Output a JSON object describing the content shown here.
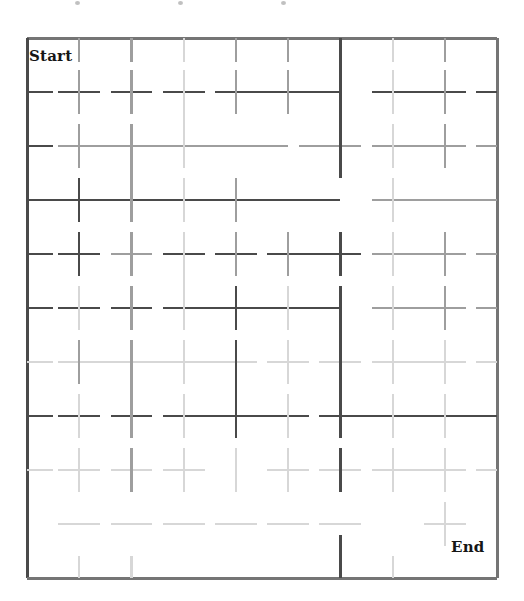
{
  "page": {
    "width": 524,
    "height": 601,
    "background": "#ffffff",
    "kind": "maze-grid-puzzle"
  },
  "labels": {
    "start": "Start",
    "end": "End"
  },
  "colors": {
    "border": "#757575",
    "line_dark": "#4a4a4a",
    "line_mid": "#9e9e9e",
    "line_light": "#d7d7d7",
    "label_text": "#161616",
    "background": "#ffffff"
  },
  "grid": {
    "x0": 27,
    "y0": 38,
    "x1": 497,
    "y1": 578,
    "cols": 9,
    "rows": 10,
    "cell_w": 52.2,
    "cell_h": 54.0,
    "col_x": [
      27,
      79.2,
      131.4,
      183.7,
      235.9,
      288.1,
      340.3,
      392.6,
      444.8,
      497
    ],
    "row_y": [
      38,
      92,
      146,
      200,
      254,
      308,
      362,
      416,
      470,
      524,
      578
    ]
  },
  "border": {
    "top": {
      "x1": 27,
      "y1": 38,
      "x2": 497,
      "y2": 38,
      "shade": "border",
      "width": 3
    },
    "left": {
      "x1": 27,
      "y1": 38,
      "x2": 27,
      "y2": 578,
      "shade": "line_dark",
      "width": 3
    },
    "right": {
      "x1": 497,
      "y1": 38,
      "x2": 497,
      "y2": 578,
      "shade": "border",
      "width": 3
    },
    "bottom": {
      "x1": 27,
      "y1": 578,
      "x2": 497,
      "y2": 578,
      "shade": "border",
      "width": 3
    }
  },
  "chart_data": {
    "type": "table",
    "xlabel": "column index",
    "ylabel": "row index",
    "note": "Each segment is drawn centered on a grid node and extends roughly one half-cell to each side. shade = dark | mid | light.",
    "horizontal_segments": [
      {
        "row": 1,
        "col_from": 0,
        "col_to": 0.5,
        "shade": "dark"
      },
      {
        "row": 1,
        "col_from": 0.6,
        "col_to": 1.4,
        "shade": "dark"
      },
      {
        "row": 1,
        "col_from": 1.6,
        "col_to": 2.4,
        "shade": "dark"
      },
      {
        "row": 1,
        "col_from": 2.6,
        "col_to": 3.4,
        "shade": "dark"
      },
      {
        "row": 1,
        "col_from": 3.6,
        "col_to": 6.0,
        "shade": "dark"
      },
      {
        "row": 1,
        "col_from": 6.6,
        "col_to": 8.4,
        "shade": "dark"
      },
      {
        "row": 1,
        "col_from": 8.6,
        "col_to": 9.0,
        "shade": "dark"
      },
      {
        "row": 2,
        "col_from": 0,
        "col_to": 0.5,
        "shade": "dark"
      },
      {
        "row": 2,
        "col_from": 0.6,
        "col_to": 5.0,
        "shade": "mid"
      },
      {
        "row": 2,
        "col_from": 5.2,
        "col_to": 6.4,
        "shade": "mid"
      },
      {
        "row": 2,
        "col_from": 6.6,
        "col_to": 8.4,
        "shade": "mid"
      },
      {
        "row": 2,
        "col_from": 8.6,
        "col_to": 9.0,
        "shade": "mid"
      },
      {
        "row": 3,
        "col_from": 0,
        "col_to": 6.0,
        "shade": "dark"
      },
      {
        "row": 3,
        "col_from": 6.6,
        "col_to": 9.0,
        "shade": "mid"
      },
      {
        "row": 4,
        "col_from": 0,
        "col_to": 0.5,
        "shade": "dark"
      },
      {
        "row": 4,
        "col_from": 0.6,
        "col_to": 1.4,
        "shade": "dark"
      },
      {
        "row": 4,
        "col_from": 1.6,
        "col_to": 2.4,
        "shade": "mid"
      },
      {
        "row": 4,
        "col_from": 2.6,
        "col_to": 3.4,
        "shade": "dark"
      },
      {
        "row": 4,
        "col_from": 3.6,
        "col_to": 4.4,
        "shade": "dark"
      },
      {
        "row": 4,
        "col_from": 4.6,
        "col_to": 6.4,
        "shade": "dark"
      },
      {
        "row": 4,
        "col_from": 6.6,
        "col_to": 8.4,
        "shade": "mid"
      },
      {
        "row": 4,
        "col_from": 8.6,
        "col_to": 9.0,
        "shade": "mid"
      },
      {
        "row": 5,
        "col_from": 0,
        "col_to": 0.5,
        "shade": "dark"
      },
      {
        "row": 5,
        "col_from": 0.6,
        "col_to": 1.4,
        "shade": "dark"
      },
      {
        "row": 5,
        "col_from": 1.6,
        "col_to": 2.4,
        "shade": "dark"
      },
      {
        "row": 5,
        "col_from": 2.6,
        "col_to": 6.0,
        "shade": "dark"
      },
      {
        "row": 5,
        "col_from": 6.6,
        "col_to": 8.4,
        "shade": "mid"
      },
      {
        "row": 5,
        "col_from": 8.6,
        "col_to": 9.0,
        "shade": "mid"
      },
      {
        "row": 6,
        "col_from": 0,
        "col_to": 0.5,
        "shade": "light"
      },
      {
        "row": 6,
        "col_from": 0.6,
        "col_to": 4.4,
        "shade": "light"
      },
      {
        "row": 6,
        "col_from": 4.6,
        "col_to": 5.4,
        "shade": "light"
      },
      {
        "row": 6,
        "col_from": 5.6,
        "col_to": 6.4,
        "shade": "light"
      },
      {
        "row": 6,
        "col_from": 6.6,
        "col_to": 8.4,
        "shade": "light"
      },
      {
        "row": 6,
        "col_from": 8.6,
        "col_to": 9.0,
        "shade": "light"
      },
      {
        "row": 7,
        "col_from": 0,
        "col_to": 0.5,
        "shade": "dark"
      },
      {
        "row": 7,
        "col_from": 0.6,
        "col_to": 1.4,
        "shade": "dark"
      },
      {
        "row": 7,
        "col_from": 1.6,
        "col_to": 2.4,
        "shade": "dark"
      },
      {
        "row": 7,
        "col_from": 2.6,
        "col_to": 5.4,
        "shade": "dark"
      },
      {
        "row": 7,
        "col_from": 5.6,
        "col_to": 9.0,
        "shade": "dark"
      },
      {
        "row": 8,
        "col_from": 0,
        "col_to": 0.5,
        "shade": "light"
      },
      {
        "row": 8,
        "col_from": 0.6,
        "col_to": 1.4,
        "shade": "light"
      },
      {
        "row": 8,
        "col_from": 1.6,
        "col_to": 2.4,
        "shade": "light"
      },
      {
        "row": 8,
        "col_from": 2.6,
        "col_to": 3.4,
        "shade": "light"
      },
      {
        "row": 8,
        "col_from": 4.6,
        "col_to": 5.4,
        "shade": "light"
      },
      {
        "row": 8,
        "col_from": 5.6,
        "col_to": 6.4,
        "shade": "light"
      },
      {
        "row": 8,
        "col_from": 6.6,
        "col_to": 8.4,
        "shade": "light"
      },
      {
        "row": 8,
        "col_from": 8.6,
        "col_to": 9.0,
        "shade": "light"
      },
      {
        "row": 9,
        "col_from": 0.6,
        "col_to": 1.4,
        "shade": "light"
      },
      {
        "row": 9,
        "col_from": 1.6,
        "col_to": 2.4,
        "shade": "light"
      },
      {
        "row": 9,
        "col_from": 2.6,
        "col_to": 3.4,
        "shade": "light"
      },
      {
        "row": 9,
        "col_from": 3.6,
        "col_to": 4.4,
        "shade": "light"
      },
      {
        "row": 9,
        "col_from": 4.6,
        "col_to": 5.4,
        "shade": "light"
      },
      {
        "row": 9,
        "col_from": 5.6,
        "col_to": 6.4,
        "shade": "light"
      },
      {
        "row": 9,
        "col_from": 7.6,
        "col_to": 8.4,
        "shade": "light"
      }
    ],
    "vertical_segments": [
      {
        "col": 1,
        "row_from": 0,
        "row_to": 0.45,
        "shade": "mid"
      },
      {
        "col": 1,
        "row_from": 0.6,
        "row_to": 1.4,
        "shade": "mid"
      },
      {
        "col": 1,
        "row_from": 1.6,
        "row_to": 2.4,
        "shade": "mid"
      },
      {
        "col": 1,
        "row_from": 2.6,
        "row_to": 3.4,
        "shade": "dark"
      },
      {
        "col": 1,
        "row_from": 3.6,
        "row_to": 4.4,
        "shade": "dark"
      },
      {
        "col": 1,
        "row_from": 4.6,
        "row_to": 5.4,
        "shade": "light"
      },
      {
        "col": 1,
        "row_from": 5.6,
        "row_to": 6.4,
        "shade": "mid"
      },
      {
        "col": 1,
        "row_from": 6.6,
        "row_to": 7.4,
        "shade": "light"
      },
      {
        "col": 1,
        "row_from": 7.6,
        "row_to": 8.4,
        "shade": "light"
      },
      {
        "col": 1,
        "row_from": 9.6,
        "row_to": 10.0,
        "shade": "light"
      },
      {
        "col": 2,
        "row_from": 0,
        "row_to": 0.45,
        "shade": "mid"
      },
      {
        "col": 2,
        "row_from": 0.6,
        "row_to": 1.4,
        "shade": "mid"
      },
      {
        "col": 2,
        "row_from": 1.6,
        "row_to": 3.4,
        "shade": "mid"
      },
      {
        "col": 2,
        "row_from": 3.6,
        "row_to": 4.4,
        "shade": "mid"
      },
      {
        "col": 2,
        "row_from": 4.6,
        "row_to": 5.4,
        "shade": "mid"
      },
      {
        "col": 2,
        "row_from": 5.6,
        "row_to": 7.4,
        "shade": "mid"
      },
      {
        "col": 2,
        "row_from": 7.6,
        "row_to": 8.4,
        "shade": "mid"
      },
      {
        "col": 2,
        "row_from": 9.6,
        "row_to": 10.0,
        "shade": "light"
      },
      {
        "col": 3,
        "row_from": 0,
        "row_to": 0.45,
        "shade": "light"
      },
      {
        "col": 3,
        "row_from": 0.6,
        "row_to": 2.4,
        "shade": "light"
      },
      {
        "col": 3,
        "row_from": 2.6,
        "row_to": 3.4,
        "shade": "light"
      },
      {
        "col": 3,
        "row_from": 3.6,
        "row_to": 5.4,
        "shade": "light"
      },
      {
        "col": 3,
        "row_from": 5.6,
        "row_to": 6.4,
        "shade": "light"
      },
      {
        "col": 3,
        "row_from": 6.6,
        "row_to": 7.4,
        "shade": "light"
      },
      {
        "col": 3,
        "row_from": 7.6,
        "row_to": 8.4,
        "shade": "light"
      },
      {
        "col": 4,
        "row_from": 0,
        "row_to": 0.45,
        "shade": "mid"
      },
      {
        "col": 4,
        "row_from": 0.6,
        "row_to": 1.4,
        "shade": "mid"
      },
      {
        "col": 4,
        "row_from": 2.6,
        "row_to": 3.4,
        "shade": "mid"
      },
      {
        "col": 4,
        "row_from": 3.6,
        "row_to": 4.4,
        "shade": "mid"
      },
      {
        "col": 4,
        "row_from": 4.6,
        "row_to": 5.4,
        "shade": "dark"
      },
      {
        "col": 4,
        "row_from": 5.6,
        "row_to": 7.4,
        "shade": "dark"
      },
      {
        "col": 4,
        "row_from": 7.6,
        "row_to": 8.4,
        "shade": "light"
      },
      {
        "col": 5,
        "row_from": 0,
        "row_to": 0.45,
        "shade": "mid"
      },
      {
        "col": 5,
        "row_from": 0.6,
        "row_to": 1.4,
        "shade": "mid"
      },
      {
        "col": 5,
        "row_from": 3.6,
        "row_to": 4.4,
        "shade": "mid"
      },
      {
        "col": 5,
        "row_from": 4.6,
        "row_to": 5.4,
        "shade": "light"
      },
      {
        "col": 5,
        "row_from": 5.6,
        "row_to": 6.4,
        "shade": "light"
      },
      {
        "col": 5,
        "row_from": 6.6,
        "row_to": 7.4,
        "shade": "light"
      },
      {
        "col": 5,
        "row_from": 7.6,
        "row_to": 8.4,
        "shade": "light"
      },
      {
        "col": 6,
        "row_from": 0,
        "row_to": 2.6,
        "shade": "dark"
      },
      {
        "col": 6,
        "row_from": 3.6,
        "row_to": 4.4,
        "shade": "dark"
      },
      {
        "col": 6,
        "row_from": 4.6,
        "row_to": 7.4,
        "shade": "dark"
      },
      {
        "col": 6,
        "row_from": 7.6,
        "row_to": 8.4,
        "shade": "dark"
      },
      {
        "col": 6,
        "row_from": 9.2,
        "row_to": 10.0,
        "shade": "dark"
      },
      {
        "col": 7,
        "row_from": 0,
        "row_to": 0.45,
        "shade": "light"
      },
      {
        "col": 7,
        "row_from": 0.6,
        "row_to": 1.4,
        "shade": "light"
      },
      {
        "col": 7,
        "row_from": 1.6,
        "row_to": 2.4,
        "shade": "light"
      },
      {
        "col": 7,
        "row_from": 2.6,
        "row_to": 3.4,
        "shade": "light"
      },
      {
        "col": 7,
        "row_from": 3.6,
        "row_to": 4.4,
        "shade": "light"
      },
      {
        "col": 7,
        "row_from": 4.6,
        "row_to": 5.4,
        "shade": "light"
      },
      {
        "col": 7,
        "row_from": 5.6,
        "row_to": 6.4,
        "shade": "light"
      },
      {
        "col": 7,
        "row_from": 6.6,
        "row_to": 7.4,
        "shade": "light"
      },
      {
        "col": 7,
        "row_from": 7.6,
        "row_to": 8.4,
        "shade": "light"
      },
      {
        "col": 7,
        "row_from": 9.6,
        "row_to": 10.0,
        "shade": "light"
      },
      {
        "col": 8,
        "row_from": 0,
        "row_to": 0.45,
        "shade": "mid"
      },
      {
        "col": 8,
        "row_from": 0.6,
        "row_to": 1.4,
        "shade": "mid"
      },
      {
        "col": 8,
        "row_from": 1.6,
        "row_to": 2.4,
        "shade": "mid"
      },
      {
        "col": 8,
        "row_from": 3.6,
        "row_to": 4.4,
        "shade": "mid"
      },
      {
        "col": 8,
        "row_from": 4.6,
        "row_to": 5.4,
        "shade": "mid"
      },
      {
        "col": 8,
        "row_from": 5.6,
        "row_to": 6.4,
        "shade": "light"
      },
      {
        "col": 8,
        "row_from": 6.6,
        "row_to": 7.4,
        "shade": "light"
      },
      {
        "col": 8,
        "row_from": 7.6,
        "row_to": 8.4,
        "shade": "light"
      },
      {
        "col": 8,
        "row_from": 8.6,
        "row_to": 9.4,
        "shade": "light"
      }
    ]
  },
  "artifacts": {
    "scan_dots": [
      {
        "x": 75,
        "y": 1
      },
      {
        "x": 178,
        "y": 1
      },
      {
        "x": 281,
        "y": 1
      }
    ]
  }
}
